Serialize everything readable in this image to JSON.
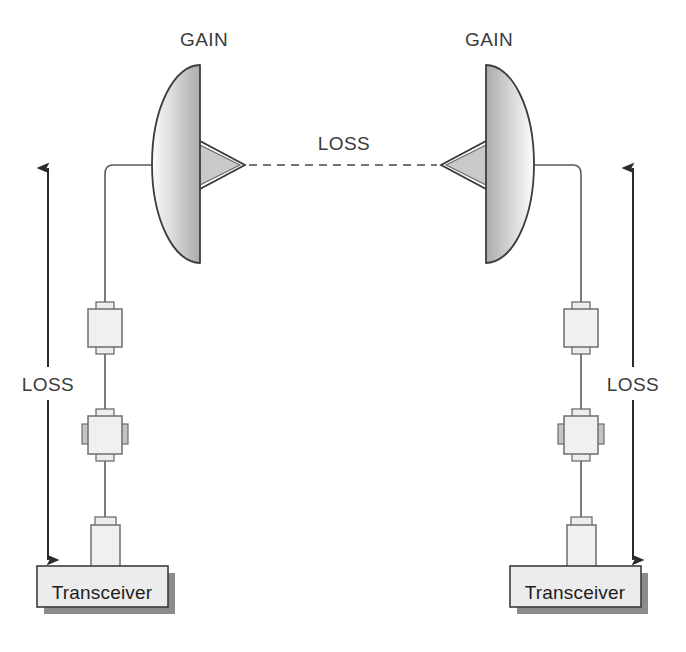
{
  "diagram": {
    "background_color": "#ffffff",
    "stroke_color": "#4a4a4a",
    "arrow_color": "#2b2b2b",
    "box_fill": "#ececec",
    "shadow_color": "#808080",
    "labels": {
      "gain_left": "GAIN",
      "gain_right": "GAIN",
      "loss_path": "LOSS",
      "loss_left": "LOSS",
      "loss_right": "LOSS",
      "transceiver_left": "Transceiver",
      "transceiver_right": "Transceiver"
    },
    "nodes": {
      "left_dish": {
        "name": "parabolic-dish-antenna",
        "orientation": "faces-left",
        "cx": 200,
        "cy": 164,
        "rx": 48,
        "ry": 99
      },
      "right_dish": {
        "name": "parabolic-dish-antenna",
        "orientation": "faces-right",
        "cx": 486,
        "cy": 164,
        "rx": 48,
        "ry": 99
      },
      "left_feed_horn": {
        "name": "feed-horn",
        "apex_x": 243,
        "apex_y": 165
      },
      "right_feed_horn": {
        "name": "feed-horn",
        "apex_x": 443,
        "apex_y": 165
      },
      "left_connector_upper": {
        "name": "waveguide-connector",
        "x": 88,
        "y": 308,
        "w": 34,
        "h": 40
      },
      "left_connector_lower": {
        "name": "waveguide-coupler",
        "x": 88,
        "y": 415,
        "w": 34,
        "h": 40
      },
      "right_connector_upper": {
        "name": "waveguide-connector",
        "x": 558,
        "y": 308,
        "w": 34,
        "h": 40
      },
      "right_connector_lower": {
        "name": "waveguide-coupler",
        "x": 558,
        "y": 415,
        "w": 34,
        "h": 40
      },
      "left_transceiver": {
        "name": "transceiver-box",
        "x": 37,
        "y": 566,
        "w": 131,
        "h": 41
      },
      "right_transceiver": {
        "name": "transceiver-box",
        "x": 510,
        "y": 566,
        "w": 131,
        "h": 41
      }
    },
    "connections": {
      "free_space_path": {
        "style": "dashed",
        "from_x": 248,
        "to_x": 438,
        "y": 165
      },
      "left_loss_arrow": {
        "style": "double-headed",
        "x": 48,
        "y_top": 168,
        "y_bottom": 560
      },
      "right_loss_arrow": {
        "style": "double-headed",
        "x": 633,
        "y_top": 168,
        "y_bottom": 560
      }
    }
  }
}
